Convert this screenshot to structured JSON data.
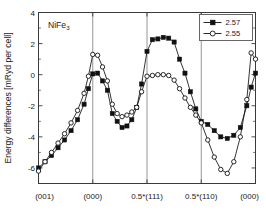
{
  "chart_data": {
    "type": "line",
    "title": "",
    "annotation": "NiFe3",
    "annotation_display": "NiFe",
    "annotation_subscript": "3",
    "xlabel": "",
    "ylabel": "Energy differences [mRyd per cell]",
    "ylim": [
      -7.0,
      4.0
    ],
    "xlim": [
      0,
      40
    ],
    "yticks": [
      4,
      2,
      0,
      -2,
      -4,
      -6
    ],
    "ytick_labels": [
      "4",
      "2",
      "0",
      "-2",
      "-4",
      "-6"
    ],
    "yminor_step": 1,
    "xticks": [
      0,
      10,
      20,
      30,
      40
    ],
    "xtick_labels": [
      "(001)",
      "(000)",
      "0.5*(111)",
      "0.5*(110)",
      "(000)"
    ],
    "gridlines_x": [
      10,
      20,
      30
    ],
    "grid": "vertical-only",
    "legend_position": "top-right",
    "series": [
      {
        "name": "2.57",
        "marker": "filled-square",
        "color": "#111111",
        "x": [
          0,
          1.2,
          2.4,
          3.6,
          4.8,
          6.0,
          7.2,
          8.4,
          9.2,
          10.0,
          10.9,
          11.8,
          12.7,
          13.6,
          14.5,
          15.4,
          16.3,
          17.2,
          18.1,
          19.0,
          20.0,
          21.0,
          22.0,
          23.0,
          24.0,
          25.0,
          26.0,
          27.0,
          28.0,
          29.0,
          30.0,
          31.2,
          32.4,
          33.6,
          34.8,
          36.0,
          37.2,
          38.4,
          39.2,
          40.0
        ],
        "values": [
          -6.0,
          -5.6,
          -5.2,
          -4.7,
          -4.2,
          -3.6,
          -2.9,
          -1.9,
          -0.9,
          0.05,
          0.1,
          -0.4,
          -1.0,
          -2.5,
          -3.0,
          -3.4,
          -3.3,
          -2.9,
          -2.1,
          -0.6,
          1.5,
          2.25,
          2.3,
          2.4,
          2.35,
          2.1,
          1.0,
          0.1,
          -1.1,
          -2.2,
          -3.0,
          -3.2,
          -3.6,
          -4.0,
          -4.1,
          -3.9,
          -3.4,
          -2.0,
          -0.8,
          0.1
        ]
      },
      {
        "name": "2.55",
        "marker": "open-circle",
        "color": "#111111",
        "x": [
          0,
          1.2,
          2.4,
          3.6,
          4.8,
          6.0,
          7.2,
          8.4,
          9.2,
          10.0,
          10.9,
          11.8,
          12.7,
          13.6,
          14.5,
          15.4,
          16.3,
          17.2,
          18.1,
          19.0,
          20.0,
          21.0,
          22.0,
          23.0,
          24.0,
          25.0,
          26.0,
          27.0,
          28.0,
          29.0,
          30.0,
          31.2,
          32.4,
          33.6,
          34.8,
          36.0,
          37.2,
          38.4,
          39.2,
          40.0
        ],
        "values": [
          -6.2,
          -5.6,
          -5.0,
          -4.4,
          -3.8,
          -3.1,
          -2.3,
          -1.2,
          -0.1,
          1.3,
          1.25,
          0.5,
          -0.4,
          -1.9,
          -2.5,
          -2.7,
          -2.6,
          -2.4,
          -2.1,
          -1.1,
          -0.1,
          -0.05,
          0.0,
          0.0,
          -0.05,
          -0.35,
          -0.9,
          -1.5,
          -2.1,
          -2.6,
          -3.1,
          -4.2,
          -5.3,
          -6.1,
          -6.35,
          -5.6,
          -4.0,
          -1.6,
          1.4,
          1.0
        ]
      }
    ]
  }
}
